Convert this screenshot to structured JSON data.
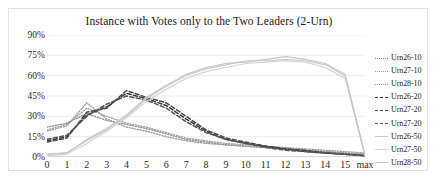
{
  "chart_data": {
    "type": "line",
    "title": "Instance with Votes only to the Two Leaders (2-Urn)",
    "xlabel": "",
    "ylabel": "",
    "grid": true,
    "legend_position": "right",
    "ylim": [
      0,
      90
    ],
    "ytick_labels": [
      "90%",
      "75%",
      "60%",
      "45%",
      "30%",
      "15%",
      "0%"
    ],
    "ytick_values": [
      90,
      75,
      60,
      45,
      30,
      15,
      0
    ],
    "categories": [
      "0",
      "1",
      "2",
      "3",
      "4",
      "5",
      "6",
      "7",
      "8",
      "9",
      "10",
      "11",
      "12",
      "13",
      "14",
      "15",
      "max"
    ],
    "series": [
      {
        "name": "Urn26-10",
        "style": "dotted",
        "color": "#8d8d8d",
        "values": [
          22,
          25,
          32,
          27,
          24,
          21,
          17,
          13,
          11,
          9,
          8,
          7,
          6,
          5,
          4,
          3,
          2
        ]
      },
      {
        "name": "Urn27-10",
        "style": "dotted",
        "color": "#a0a0a0",
        "values": [
          20,
          24,
          36,
          30,
          25,
          22,
          18,
          14,
          12,
          10,
          9,
          8,
          7,
          6,
          5,
          4,
          3
        ]
      },
      {
        "name": "Urn28-10",
        "style": "dotted",
        "color": "#9a9a9a",
        "values": [
          19,
          23,
          40,
          28,
          22,
          19,
          15,
          12,
          10,
          9,
          8,
          7,
          6,
          5,
          4,
          3,
          2
        ]
      },
      {
        "name": "Urn26-20",
        "style": "dashed",
        "color": "#3a3a3a",
        "values": [
          12,
          15,
          31,
          37,
          47,
          43,
          38,
          28,
          19,
          13,
          10,
          8,
          6,
          4,
          3,
          2,
          1
        ]
      },
      {
        "name": "Urn27-20",
        "style": "dashed",
        "color": "#4a4a4a",
        "values": [
          11,
          14,
          33,
          36,
          49,
          44,
          40,
          30,
          20,
          14,
          11,
          8,
          6,
          5,
          3,
          2,
          1
        ]
      },
      {
        "name": "Urn27-20b",
        "style": "dashed",
        "color": "#555555",
        "values": [
          13,
          16,
          30,
          39,
          45,
          42,
          36,
          26,
          18,
          13,
          10,
          7,
          5,
          4,
          3,
          2,
          1
        ]
      },
      {
        "name": "Urn26-50",
        "style": "solid",
        "color": "#cccccc",
        "values": [
          2,
          3,
          12,
          20,
          30,
          43,
          52,
          60,
          65,
          68,
          71,
          71,
          72,
          71,
          68,
          60,
          1
        ]
      },
      {
        "name": "Urn27-50",
        "style": "solid",
        "color": "#d4d4d4",
        "values": [
          1,
          2,
          10,
          19,
          29,
          41,
          50,
          58,
          63,
          66,
          69,
          70,
          71,
          70,
          66,
          58,
          1
        ]
      },
      {
        "name": "Urn28-50",
        "style": "solid",
        "color": "#c6c6c6",
        "values": [
          2,
          3,
          13,
          21,
          31,
          44,
          53,
          61,
          66,
          69,
          70,
          72,
          74,
          72,
          69,
          61,
          1
        ]
      }
    ]
  },
  "legend": {
    "entries": [
      {
        "label": "Urn26-10",
        "style": "dotted",
        "color": "#8d8d8d"
      },
      {
        "label": "Urn27-10",
        "style": "dotted",
        "color": "#a0a0a0"
      },
      {
        "label": "Urn28-10",
        "style": "dotted",
        "color": "#9a9a9a"
      },
      {
        "label": "Urn26-20",
        "style": "dashed",
        "color": "#3a3a3a"
      },
      {
        "label": "Urn27-20",
        "style": "dashed",
        "color": "#4a4a4a"
      },
      {
        "label": "Urn27-20",
        "style": "dashed",
        "color": "#555555"
      },
      {
        "label": "Urn26-50",
        "style": "solid",
        "color": "#cccccc"
      },
      {
        "label": "Urn27-50",
        "style": "solid",
        "color": "#d4d4d4"
      },
      {
        "label": "Urn28-50",
        "style": "solid",
        "color": "#c6c6c6"
      }
    ]
  },
  "colors": {
    "frame_border": "#e2e2e2",
    "gridline": "#ededed",
    "text": "#1f1f1f",
    "background": "#ffffff"
  }
}
